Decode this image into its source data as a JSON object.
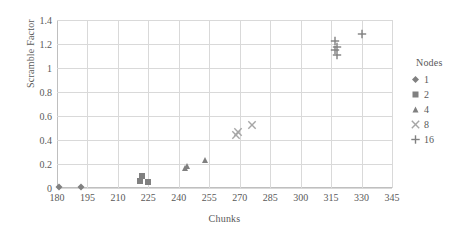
{
  "chart_data": {
    "type": "scatter",
    "title": "",
    "xlabel": "Chunks",
    "ylabel": "Scramble Factor",
    "xlim": [
      180,
      345
    ],
    "ylim": [
      0,
      1.4
    ],
    "xticks": [
      180,
      195,
      210,
      225,
      240,
      255,
      270,
      285,
      300,
      315,
      330,
      345
    ],
    "yticks": [
      0,
      0.2,
      0.4,
      0.6,
      0.8,
      1,
      1.2,
      1.4
    ],
    "ytick_labels": [
      "0",
      "0.2",
      "0.4",
      "0.6",
      "0.8",
      "1",
      "1.2",
      "1.4"
    ],
    "xtick_labels": [
      "180",
      "195",
      "210",
      "225",
      "240",
      "255",
      "270",
      "285",
      "300",
      "315",
      "330",
      "345"
    ],
    "grid": "both",
    "legend_title": "Nodes",
    "legend_position": "right",
    "marker_color": "#808080",
    "series": [
      {
        "name": "1",
        "marker": "diamond",
        "color": "#808080",
        "points": [
          {
            "x": 181,
            "y": 0.005
          },
          {
            "x": 192,
            "y": 0.005
          }
        ]
      },
      {
        "name": "2",
        "marker": "square",
        "color": "#808080",
        "points": [
          {
            "x": 221,
            "y": 0.055
          },
          {
            "x": 222,
            "y": 0.1
          },
          {
            "x": 225,
            "y": 0.05
          }
        ]
      },
      {
        "name": "4",
        "marker": "triangle",
        "color": "#808080",
        "points": [
          {
            "x": 243,
            "y": 0.165
          },
          {
            "x": 244,
            "y": 0.18
          },
          {
            "x": 253,
            "y": 0.235
          }
        ]
      },
      {
        "name": "8",
        "marker": "cross-x",
        "color": "#a6a6a6",
        "points": [
          {
            "x": 268,
            "y": 0.44
          },
          {
            "x": 269,
            "y": 0.47
          },
          {
            "x": 276,
            "y": 0.525
          }
        ]
      },
      {
        "name": "16",
        "marker": "plus",
        "color": "#808080",
        "points": [
          {
            "x": 317,
            "y": 1.225
          },
          {
            "x": 318,
            "y": 1.175
          },
          {
            "x": 317,
            "y": 1.15
          },
          {
            "x": 318,
            "y": 1.105
          },
          {
            "x": 330,
            "y": 1.285
          }
        ]
      }
    ]
  }
}
